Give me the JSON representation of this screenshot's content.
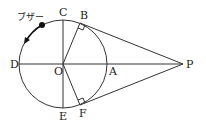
{
  "diagram": {
    "title": "",
    "buzzer_label": "ブザー",
    "points": {
      "O": {
        "label": "O",
        "x": 63,
        "y": 64
      },
      "A": {
        "label": "A",
        "x": 107,
        "y": 64
      },
      "B": {
        "label": "B",
        "x": 80,
        "y": 23
      },
      "C": {
        "label": "C",
        "x": 63,
        "y": 20
      },
      "D": {
        "label": "D",
        "x": 19,
        "y": 64
      },
      "E": {
        "label": "E",
        "x": 63,
        "y": 108
      },
      "F": {
        "label": "F",
        "x": 80,
        "y": 105
      },
      "P": {
        "label": "P",
        "x": 183,
        "y": 64
      }
    },
    "circle": {
      "center": "O",
      "radius": 44
    },
    "segments": [
      "CE",
      "DP",
      "OB",
      "OF",
      "BP",
      "FP"
    ],
    "right_angles": [
      "OBP",
      "OFP"
    ],
    "arrow": "buzzer moves counterclockwise along arc from near C toward D",
    "stroke_color": "#333333"
  }
}
